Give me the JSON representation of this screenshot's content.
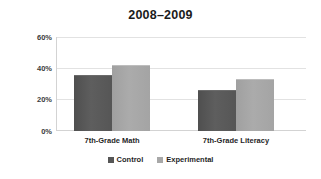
{
  "chart_data": {
    "type": "bar",
    "title": "2008–2009",
    "xlabel": "",
    "ylabel": "",
    "categories": [
      "7th-Grade Math",
      "7th-Grade Literacy"
    ],
    "series": [
      {
        "name": "Control",
        "values": [
          36,
          26
        ],
        "color": "#565656"
      },
      {
        "name": "Experimental",
        "values": [
          42,
          33
        ],
        "color": "#a8a8a8"
      }
    ],
    "ylim": [
      0,
      60
    ],
    "yticks": [
      60,
      40,
      20,
      0
    ],
    "ytick_labels": [
      "60%",
      "40%",
      "20%",
      "0%"
    ],
    "grid": true,
    "legend_position": "bottom-center",
    "value_format": "percent"
  },
  "legend": {
    "items": [
      {
        "label": "Control",
        "swatch": "legend-swatch-control"
      },
      {
        "label": "Experimental",
        "swatch": "legend-swatch-experimental"
      }
    ]
  }
}
